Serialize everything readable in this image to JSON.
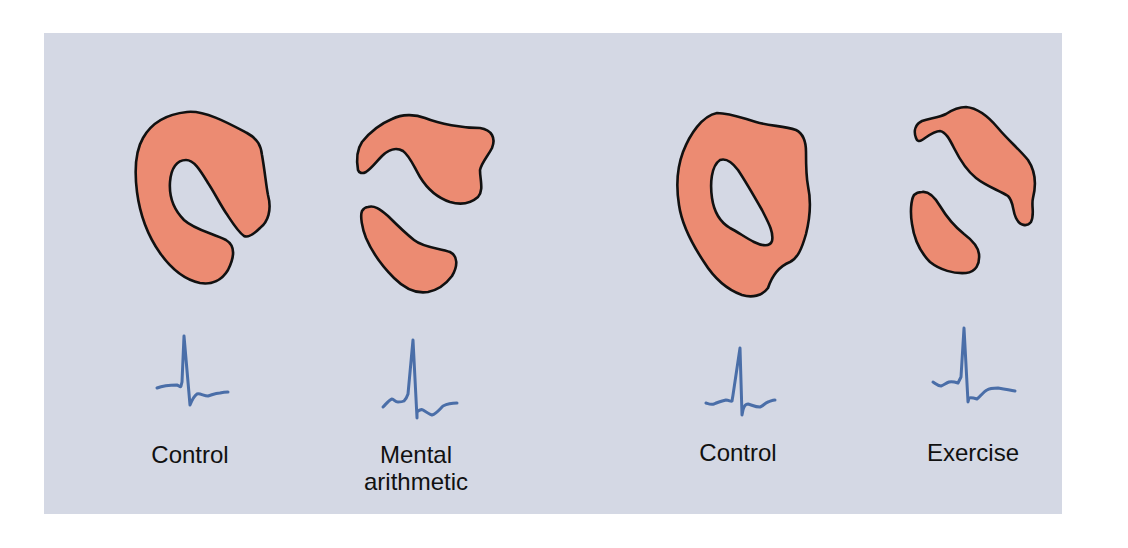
{
  "figure": {
    "colors": {
      "panel_background": "#d4d8e4",
      "myocardium_fill": "#ec8b72",
      "outline": "#111111",
      "ecg_trace": "#4a6ea8"
    },
    "groups": [
      {
        "panels": [
          {
            "label_lines": [
              "Control"
            ],
            "perfusion": "uniform ring",
            "ecg": "normal"
          },
          {
            "label_lines": [
              "Mental",
              "arithmetic"
            ],
            "perfusion": "split (defect)",
            "ecg": "ST depression"
          }
        ]
      },
      {
        "panels": [
          {
            "label_lines": [
              "Control"
            ],
            "perfusion": "uniform ring",
            "ecg": "normal"
          },
          {
            "label_lines": [
              "Exercise"
            ],
            "perfusion": "split (defect)",
            "ecg": "ST depression"
          }
        ]
      }
    ]
  },
  "labels": {
    "control_1": "Control",
    "mental_line1": "Mental",
    "mental_line2": "arithmetic",
    "control_2": "Control",
    "exercise": "Exercise"
  }
}
